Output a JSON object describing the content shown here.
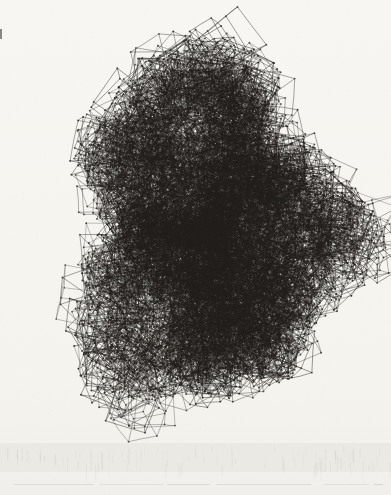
{
  "artwork": {
    "name": "wireframe-cube-cluster-print",
    "canvas_width": 391,
    "canvas_height": 495,
    "background_top": "#f7f6f2",
    "background_mid": "#f4f3ee",
    "background_bottom": "#f1efeb",
    "ink_color": "#221f1c",
    "cluster": {
      "center_x": 209,
      "center_y": 233,
      "radius_x": 150,
      "radius_y": 206,
      "seed": 20,
      "cube_count": 1480,
      "core_cube_count": 430,
      "satellite_cluster_count": 13,
      "min_cube_size": 15,
      "max_cube_size": 40
    },
    "paper_shadow_band": {
      "y": 443,
      "height": 29,
      "color": "#e6e4df"
    },
    "paper_edge_line": {
      "y": 484,
      "x1": 14,
      "x2": 383,
      "color": "#c2c0bb"
    },
    "left_edge_mark": {
      "x": 0,
      "y": 29,
      "width": 2,
      "height": 10,
      "color": "#6b6b68"
    }
  }
}
